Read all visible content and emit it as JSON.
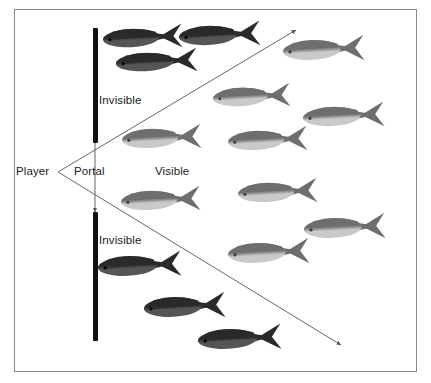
{
  "figure": {
    "kind": "diagram",
    "background_color": "#ffffff",
    "frame_color": "#8a8a8a",
    "frame": {
      "x": 14,
      "y": 9,
      "width": 403,
      "height": 363
    }
  },
  "labels": [
    {
      "name": "player-label",
      "text": "Player",
      "x": 16,
      "y": 165
    },
    {
      "name": "portal-label",
      "text": "Portal",
      "x": 74,
      "y": 165
    },
    {
      "name": "visible-label",
      "text": "Visible",
      "x": 155,
      "y": 165
    },
    {
      "name": "invisible-label-top",
      "text": "Invisible",
      "x": 99,
      "y": 94
    },
    {
      "name": "invisible-label-bottom",
      "text": "Invisible",
      "x": 99,
      "y": 234
    }
  ],
  "walls": [
    {
      "name": "wall-upper",
      "x": 93,
      "y": 28,
      "width": 5,
      "height": 115,
      "color": "#111111"
    },
    {
      "name": "wall-lower",
      "x": 93,
      "y": 212,
      "width": 5,
      "height": 129,
      "color": "#111111"
    }
  ],
  "portal": {
    "name": "portal-opening",
    "x": 95,
    "y_top": 143,
    "y_bottom": 212,
    "arrow_color": "#555555"
  },
  "sight_lines": {
    "color": "#555555",
    "origin": {
      "x": 58,
      "y": 172
    },
    "upper": {
      "x1": 58,
      "y1": 172,
      "x2": 296,
      "y2": 30
    },
    "lower": {
      "x1": 58,
      "y1": 172,
      "x2": 341,
      "y2": 345
    }
  },
  "colors": {
    "fish_dark_back": "#2a2a2a",
    "fish_dark_belly": "#555555",
    "fish_light_back": "#6e6e6e",
    "fish_light_belly": "#c9c9c9",
    "wall": "#111111",
    "line": "#555555",
    "frame": "#8a8a8a",
    "text": "#1a1a1a"
  },
  "fish": [
    {
      "name": "fish-dark-1",
      "shade": "dark",
      "x": 104,
      "y": 24,
      "w": 78,
      "h": 27,
      "rot": -3
    },
    {
      "name": "fish-dark-2",
      "shade": "dark",
      "x": 180,
      "y": 21,
      "w": 80,
      "h": 28,
      "rot": -3
    },
    {
      "name": "fish-dark-3",
      "shade": "dark",
      "x": 117,
      "y": 48,
      "w": 80,
      "h": 27,
      "rot": -3
    },
    {
      "name": "fish-dark-4",
      "shade": "dark",
      "x": 99,
      "y": 251,
      "w": 82,
      "h": 29,
      "rot": -3
    },
    {
      "name": "fish-dark-5",
      "shade": "dark",
      "x": 145,
      "y": 292,
      "w": 80,
      "h": 29,
      "rot": -3
    },
    {
      "name": "fish-dark-6",
      "shade": "dark",
      "x": 199,
      "y": 324,
      "w": 82,
      "h": 29,
      "rot": -3
    },
    {
      "name": "fish-light-1",
      "shade": "light",
      "x": 284,
      "y": 35,
      "w": 80,
      "h": 29,
      "rot": -3
    },
    {
      "name": "fish-light-2",
      "shade": "light",
      "x": 214,
      "y": 83,
      "w": 76,
      "h": 27,
      "rot": -3
    },
    {
      "name": "fish-light-3",
      "shade": "light",
      "x": 304,
      "y": 102,
      "w": 80,
      "h": 28,
      "rot": -3
    },
    {
      "name": "fish-light-4",
      "shade": "light",
      "x": 229,
      "y": 126,
      "w": 78,
      "h": 28,
      "rot": -3
    },
    {
      "name": "fish-light-5",
      "shade": "light",
      "x": 123,
      "y": 124,
      "w": 78,
      "h": 28,
      "rot": -3
    },
    {
      "name": "fish-light-6",
      "shade": "light",
      "x": 122,
      "y": 186,
      "w": 78,
      "h": 28,
      "rot": -3
    },
    {
      "name": "fish-light-7",
      "shade": "light",
      "x": 239,
      "y": 178,
      "w": 78,
      "h": 28,
      "rot": -3
    },
    {
      "name": "fish-light-8",
      "shade": "light",
      "x": 305,
      "y": 213,
      "w": 80,
      "h": 29,
      "rot": -3
    },
    {
      "name": "fish-light-9",
      "shade": "light",
      "x": 229,
      "y": 238,
      "w": 80,
      "h": 29,
      "rot": -3
    }
  ]
}
